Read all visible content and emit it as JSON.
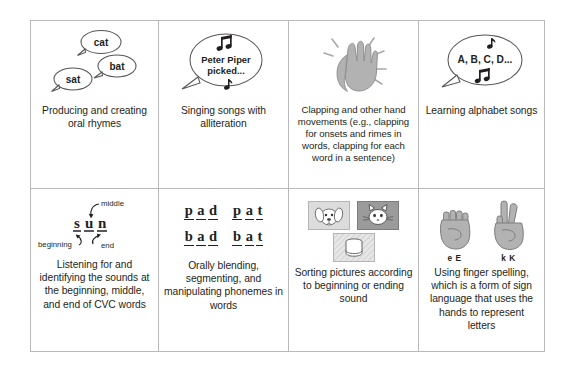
{
  "figure": {
    "layout": {
      "columns": 4,
      "rows": 2
    },
    "colors": {
      "border": "#b9b9bb",
      "text": "#231f20",
      "hand_fill": "#b0b0b0",
      "hand_stroke": "#6e6e6e",
      "card_light": "#d9d9d9",
      "card_dark": "#9a9a9a",
      "bubble_stroke": "#4d4d4d"
    }
  },
  "cells": [
    {
      "id": "producing-rhymes",
      "art": "speech-bubbles-rhyming-words",
      "bubbles": [
        "cat",
        "bat",
        "sat"
      ],
      "caption": "Producing and creating oral rhymes"
    },
    {
      "id": "alliteration-songs",
      "art": "speech-bubble-with-music-notes",
      "bubble_lines": [
        "Peter Piper",
        "picked..."
      ],
      "caption": "Singing songs with alliteration"
    },
    {
      "id": "clapping-hand-movements",
      "art": "clapping-hands-illustration",
      "caption": "Clapping and other hand movements (e.g., clapping for onsets and rimes in words, clapping for each word in a sentence)"
    },
    {
      "id": "alphabet-songs",
      "art": "speech-bubble-alphabet-with-notes",
      "bubble_lines": [
        "A, B, C, D..."
      ],
      "caption": "Learning alphabet songs"
    },
    {
      "id": "cvc-sounds",
      "art": "sun-word-with-position-labels",
      "word_letters": [
        "s",
        "u",
        "n"
      ],
      "labels": {
        "beginning": "beginning",
        "middle": "middle",
        "end": "end"
      },
      "caption": "Listening for and identifying the sounds at the beginning, middle, and end of CVC words"
    },
    {
      "id": "blending-segmenting",
      "art": "word-family-letter-grid",
      "word_rows": [
        [
          [
            "p",
            "a",
            "d"
          ],
          [
            "p",
            "a",
            "t"
          ]
        ],
        [
          [
            "b",
            "a",
            "d"
          ],
          [
            "b",
            "a",
            "t"
          ]
        ]
      ],
      "caption": "Orally blending, segmenting, and manipulating phonemes in words"
    },
    {
      "id": "sorting-pictures",
      "art": "picture-sort-cards",
      "cards": [
        "dog",
        "cat",
        "cup"
      ],
      "caption": "Sorting pictures according to beginning or ending sound"
    },
    {
      "id": "finger-spelling",
      "art": "asl-finger-spelling-hands",
      "hand_labels": [
        "e E",
        "k K"
      ],
      "caption": "Using finger spelling, which is a form of sign language that uses the hands to represent letters"
    }
  ]
}
